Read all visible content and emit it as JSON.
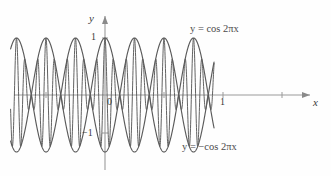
{
  "figure": {
    "kind": "line-plot",
    "axes": {
      "x_label": "x",
      "y_label": "y",
      "origin_label": "0",
      "y_tick_pos": "1",
      "y_tick_neg": "−1",
      "x_tick_one": "1"
    },
    "annotations": {
      "upper_envelope": "y = cos 2πx",
      "lower_envelope": "y = −cos 2πx"
    },
    "colors": {
      "curve": "#5a5a5a",
      "axis": "#8a8a8a",
      "text": "#3a3a3a",
      "background": "#fefefe"
    }
  },
  "chart_data": {
    "type": "line",
    "title": "",
    "xlabel": "x",
    "ylabel": "y",
    "xlim": [
      -1.6,
      1.85
    ],
    "ylim": [
      -1.35,
      1.35
    ],
    "grid": false,
    "legend": "inline-annotations",
    "xticks": [
      0,
      1
    ],
    "xticklabels": [
      "0",
      "1"
    ],
    "yticks": [
      -1,
      1
    ],
    "yticklabels": [
      "−1",
      "1"
    ],
    "annotations": [
      {
        "text": "y = cos 2πx",
        "x": 0.95,
        "y": 1.22
      },
      {
        "text": "y = −cos 2πx",
        "x": 0.92,
        "y": -1.22
      }
    ],
    "series": [
      {
        "name": "y = cos 2πx",
        "role": "upper envelope",
        "formula": "cos(2*pi*x)",
        "amplitude": 1,
        "period": 1
      },
      {
        "name": "y = −cos 2πx",
        "role": "lower envelope",
        "formula": "-cos(2*pi*x)",
        "amplitude": 1,
        "period": 1
      },
      {
        "name": "modulated oscillation",
        "role": "oscillating curve between envelopes",
        "formula": "cos(2*pi*x)*cos(2*pi*7*x)",
        "carrier_period": 0.142857,
        "envelope_period": 1
      }
    ]
  }
}
